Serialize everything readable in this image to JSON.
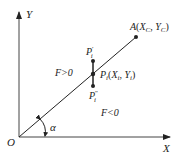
{
  "diagram": {
    "axes": {
      "x_label": "X",
      "y_label": "Y",
      "origin_label": "O"
    },
    "angle_label": "α",
    "point_A": {
      "name": "A",
      "sub_x": "C",
      "sub_y": "C"
    },
    "point_P": {
      "name": "P",
      "sub": "i"
    },
    "point_P_prime": {
      "name": "P",
      "sub": "i",
      "mark": "′"
    },
    "point_P_dprime": {
      "name": "P",
      "sub": "i",
      "mark": "″"
    },
    "region_above": "F>0",
    "region_below": "F<0",
    "colors": {
      "line": "#222222",
      "background": "#ffffff"
    }
  }
}
